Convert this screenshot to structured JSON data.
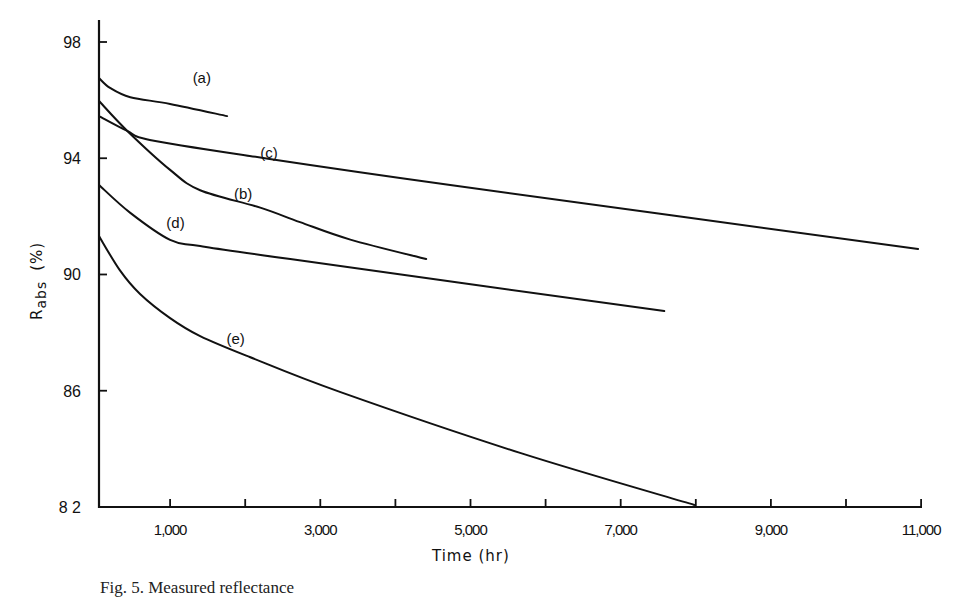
{
  "chart_data": {
    "type": "line",
    "title": "",
    "xlabel": "Time (hr)",
    "ylabel": "R_abs (%)",
    "ylabel_main": "R",
    "ylabel_sub": "abs",
    "ylabel_unit": "(%)",
    "xlim": [
      0,
      11000
    ],
    "ylim": [
      82,
      98.7
    ],
    "grid": false,
    "legend": "inline labels",
    "x_ticks": [
      1000,
      2000,
      3000,
      4000,
      5000,
      6000,
      7000,
      8000,
      9000,
      10000,
      11000
    ],
    "x_tick_labels": [
      {
        "value": 1000,
        "label": "1,000"
      },
      {
        "value": 3000,
        "label": "3,000"
      },
      {
        "value": 5000,
        "label": "5,000"
      },
      {
        "value": 7000,
        "label": "7,000"
      },
      {
        "value": 9000,
        "label": "9,000"
      },
      {
        "value": 11000,
        "label": "11,000"
      }
    ],
    "y_ticks": [
      {
        "value": 98,
        "label": "98"
      },
      {
        "value": 94,
        "label": "94"
      },
      {
        "value": 90,
        "label": "90"
      },
      {
        "value": 86,
        "label": "86"
      },
      {
        "value": 82,
        "label": "8 2"
      }
    ],
    "series": [
      {
        "name": "(a)",
        "label_pos": [
          1300,
          96.6
        ],
        "x": [
          50,
          200,
          470,
          1000,
          1760
        ],
        "y": [
          96.76,
          96.42,
          96.1,
          95.87,
          95.45
        ]
      },
      {
        "name": "(b)",
        "label_pos": [
          1850,
          92.6
        ],
        "x": [
          50,
          430,
          1000,
          1400,
          2200,
          2730,
          3400,
          4410
        ],
        "y": [
          95.97,
          94.94,
          93.6,
          92.9,
          92.3,
          91.8,
          91.2,
          90.53
        ]
      },
      {
        "name": "(c)",
        "label_pos": [
          2200,
          94.0
        ],
        "x": [
          50,
          430,
          730,
          2060,
          4730,
          10960
        ],
        "y": [
          95.45,
          94.94,
          94.63,
          94.08,
          93.08,
          90.88
        ]
      },
      {
        "name": "(d)",
        "label_pos": [
          950,
          91.6
        ],
        "x": [
          50,
          470,
          1000,
          1400,
          2600,
          7580
        ],
        "y": [
          93.08,
          92.12,
          91.19,
          90.98,
          90.53,
          88.74
        ]
      },
      {
        "name": "(e)",
        "label_pos": [
          1750,
          87.6
        ],
        "x": [
          50,
          330,
          600,
          1000,
          1400,
          2060,
          3260,
          5660,
          7980
        ],
        "y": [
          91.32,
          90.15,
          89.33,
          88.5,
          87.88,
          87.16,
          85.96,
          83.86,
          82.07
        ]
      }
    ]
  },
  "layout": {
    "origin_px": [
      95,
      507
    ],
    "px_per_hr": 0.0751,
    "y_ref_value": 98,
    "y_ref_px": 42,
    "px_per_pct": 29.06,
    "y_axis_top_px": 20,
    "x_axis_end_px": 922
  },
  "caption": "Fig. 5.  Measured reflectance"
}
